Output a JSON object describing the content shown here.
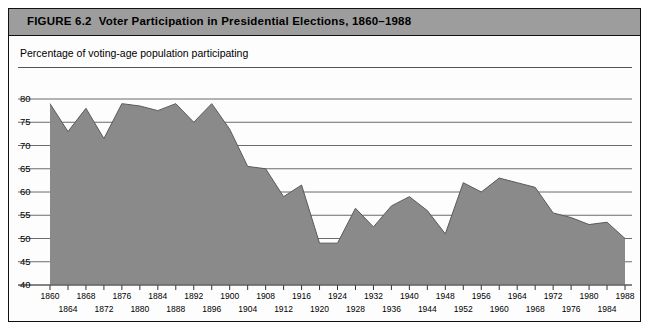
{
  "figure": {
    "number": "FIGURE 6.2",
    "title": "Voter Participation in Presidential Elections, 1860–1988",
    "subtitle": "Percentage of voting-age population participating"
  },
  "colors": {
    "header_band": "#9d9d9d",
    "area_fill": "#8a8a8a",
    "area_line": "#5a5a5a",
    "grid": "#6b6b6b",
    "border": "#111111",
    "plot_background": "#fdfdfd"
  },
  "chart_data": {
    "type": "area",
    "title": "Voter Participation in Presidential Elections, 1860–1988",
    "subtitle": "Percentage of voting-age population participating",
    "xlabel": "",
    "ylabel": "Percentage of voting-age population participating",
    "xlim": [
      1860,
      1988
    ],
    "ylim": [
      38,
      81
    ],
    "ytick_values": [
      80,
      75,
      70,
      65,
      60,
      55,
      50,
      45,
      40
    ],
    "ytick_labels": [
      "80",
      "75",
      "70",
      "65",
      "60",
      "55",
      "50",
      "45",
      "40"
    ],
    "grid": true,
    "legend": false,
    "x": [
      1860,
      1864,
      1868,
      1872,
      1876,
      1880,
      1884,
      1888,
      1892,
      1896,
      1900,
      1904,
      1908,
      1912,
      1916,
      1920,
      1924,
      1928,
      1932,
      1936,
      1940,
      1944,
      1948,
      1952,
      1956,
      1960,
      1964,
      1968,
      1972,
      1976,
      1980,
      1984,
      1988
    ],
    "values": [
      79.0,
      73.0,
      78.0,
      71.5,
      79.0,
      78.5,
      77.5,
      79.0,
      75.0,
      79.0,
      73.5,
      65.5,
      65.0,
      59.0,
      61.5,
      49.0,
      49.0,
      56.5,
      52.5,
      57.0,
      59.0,
      56.0,
      51.0,
      62.0,
      60.0,
      63.0,
      62.0,
      61.0,
      55.5,
      54.5,
      53.0,
      53.5,
      50.0
    ],
    "xtick_labels_top": [
      "1860",
      "1868",
      "1876",
      "1884",
      "1892",
      "1900",
      "1908",
      "1916",
      "1924",
      "1932",
      "1940",
      "1948",
      "1956",
      "1964",
      "1972",
      "1980",
      "1988"
    ],
    "xtick_labels_bottom": [
      "1864",
      "1872",
      "1880",
      "1888",
      "1896",
      "1904",
      "1912",
      "1920",
      "1928",
      "1936",
      "1944",
      "1952",
      "1960",
      "1968",
      "1976",
      "1984"
    ]
  }
}
